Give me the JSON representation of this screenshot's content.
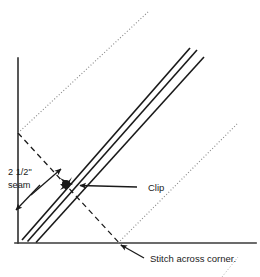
{
  "diagram": {
    "background_color": "#ffffff",
    "ink_color": "#1a1a1a",
    "faint_color": "#8a8a8a",
    "labels": {
      "seam_line1": "2 1/2\"",
      "seam_line2": "seam",
      "clip": "Clip",
      "stitch": "Stitch across corner."
    },
    "geometry": {
      "fabric_left_edge": {
        "x1": 18,
        "y1": 58,
        "x2": 18,
        "y2": 243
      },
      "fabric_bottom_edge": {
        "x1": 15,
        "y1": 243,
        "x2": 256,
        "y2": 243
      },
      "seam_band_lines": [
        {
          "x1": 22,
          "y1": 240,
          "x2": 190,
          "y2": 48
        },
        {
          "x1": 27,
          "y1": 241,
          "x2": 197,
          "y2": 50
        },
        {
          "x1": 36,
          "y1": 242,
          "x2": 204,
          "y2": 57
        }
      ],
      "fold_dotted_upper_left": {
        "x1": 18,
        "y1": 133,
        "x2": 148,
        "y2": 12
      },
      "fold_dotted_lower_right": {
        "x1": 118,
        "y1": 243,
        "x2": 237,
        "y2": 124
      },
      "stitch_dashed_line": {
        "x1": 18,
        "y1": 133,
        "x2": 122,
        "y2": 246
      },
      "clip_marker": {
        "x": 66,
        "y": 184
      },
      "clip_leader": {
        "x1": 137,
        "y1": 188,
        "x2": 78,
        "y2": 186
      },
      "stitch_leader": {
        "x1": 142,
        "y1": 258,
        "x2": 121,
        "y2": 246
      },
      "seam_arrow_up": {
        "x1": 33,
        "y1": 193,
        "x2": 62,
        "y2": 168
      },
      "seam_arrow_down": {
        "x1": 38,
        "y1": 186,
        "x2": 15,
        "y2": 211
      }
    },
    "label_positions": {
      "seam_line1": {
        "x": 8,
        "y": 173
      },
      "seam_line2": {
        "x": 8,
        "y": 186
      },
      "clip": {
        "x": 141,
        "y": 188
      },
      "stitch": {
        "x": 146,
        "y": 258
      }
    }
  }
}
